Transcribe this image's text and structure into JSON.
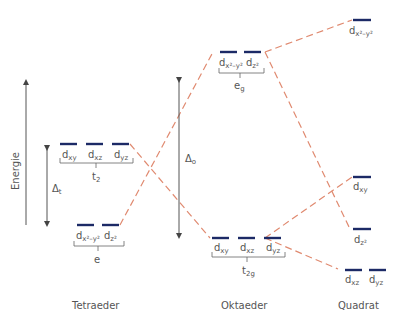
{
  "diagram": {
    "axis_label": "Energie",
    "colors": {
      "level": "#1c2a66",
      "correlation": "#e08a70",
      "text": "#555555"
    },
    "columns": [
      {
        "name": "Tetraeder",
        "splitting_label": "Δ",
        "splitting_sub": "t",
        "groups": [
          {
            "label": "t",
            "label_sub": "2",
            "orbitals": [
              {
                "base": "d",
                "sub": "xy"
              },
              {
                "base": "d",
                "sub": "xz"
              },
              {
                "base": "d",
                "sub": "yz"
              }
            ]
          },
          {
            "label": "e",
            "label_sub": "",
            "orbitals": [
              {
                "base": "d",
                "sub": "x²–y²"
              },
              {
                "base": "d",
                "sub": "z²"
              }
            ]
          }
        ]
      },
      {
        "name": "Oktaeder",
        "splitting_label": "Δ",
        "splitting_sub": "o",
        "groups": [
          {
            "label": "e",
            "label_sub": "g",
            "orbitals": [
              {
                "base": "d",
                "sub": "x²–y²"
              },
              {
                "base": "d",
                "sub": "z²"
              }
            ]
          },
          {
            "label": "t",
            "label_sub": "2g",
            "orbitals": [
              {
                "base": "d",
                "sub": "xy"
              },
              {
                "base": "d",
                "sub": "xz"
              },
              {
                "base": "d",
                "sub": "yz"
              }
            ]
          }
        ]
      },
      {
        "name": "Quadrat",
        "levels": [
          {
            "orbitals": [
              {
                "base": "d",
                "sub": "x²–y²"
              }
            ]
          },
          {
            "orbitals": [
              {
                "base": "d",
                "sub": "xy"
              }
            ]
          },
          {
            "orbitals": [
              {
                "base": "d",
                "sub": "z²"
              }
            ]
          },
          {
            "orbitals": [
              {
                "base": "d",
                "sub": "xz"
              },
              {
                "base": "d",
                "sub": "yz"
              }
            ]
          }
        ]
      }
    ]
  }
}
